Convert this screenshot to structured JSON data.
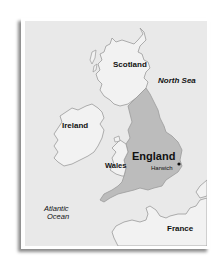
{
  "map": {
    "title": "",
    "colors": {
      "sea": "#e9e9e9",
      "land": "#f2f2f2",
      "highlight": "#bcbcbc",
      "border": "#9a9a9a",
      "text": "#111111",
      "card": "#ffffff"
    },
    "labels": {
      "scotland": "Scotland",
      "north_sea": "North Sea",
      "ireland": "Ireland",
      "england": "England",
      "harwich": "Harwich",
      "wales": "Wales",
      "atlantic_line1": "Atlantic",
      "atlantic_line2": "Ocean",
      "france": "France"
    },
    "highlighted_region": "England",
    "marker": {
      "name": "Harwich",
      "icon": "location-dot-icon"
    }
  }
}
